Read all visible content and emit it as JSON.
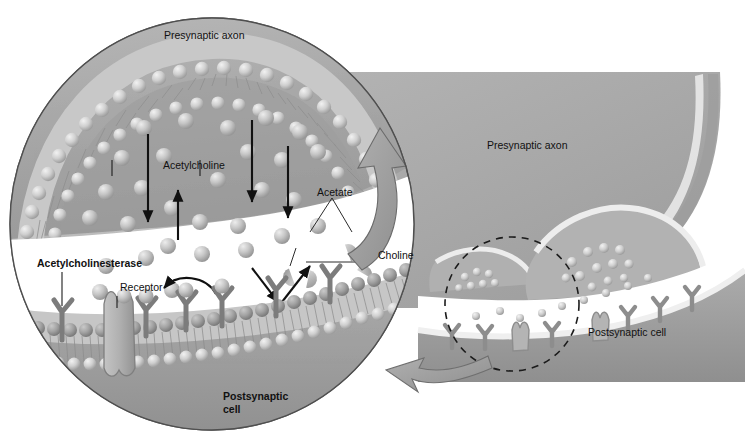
{
  "figure": {
    "type": "biological-diagram",
    "background_color": "#ffffff"
  },
  "colors": {
    "cytoplasm_gray": "#a6a6a6",
    "axon_gray": "#ababab",
    "postsynaptic_gray": "#a2a2a2",
    "membrane_head": "#c9c9c9",
    "receptor_dark": "#8a8a8a",
    "cleft_white": "#ffffff",
    "outline": "#4a4a4a",
    "arrow_black": "#111111",
    "big_arrow_fill": "#9a9a9a",
    "text": "#111111"
  },
  "magnified_view": {
    "name": "magnified-synapse-circle",
    "shape": "ellipse",
    "labels": {
      "presynaptic_axon": "Presynaptic axon",
      "acetylcholine": "Acetylcholine",
      "acetate": "Acetate",
      "choline": "Choline",
      "acetylcholinesterase": "Acetylcholinesterase",
      "receptor": "Receptor",
      "postsynaptic_cell_line1": "Postsynaptic",
      "postsynaptic_cell_line2": "cell"
    },
    "bold_labels": [
      "Acetylcholinesterase",
      "Postsynaptic cell"
    ],
    "arrows": [
      {
        "name": "ach-diffusion-arrow-1",
        "direction": "down"
      },
      {
        "name": "choline-reuptake-arrow",
        "direction": "up"
      },
      {
        "name": "ach-diffusion-arrow-2",
        "direction": "down"
      },
      {
        "name": "ach-diffusion-arrow-3",
        "direction": "down"
      },
      {
        "name": "ach-to-esterase-arrow",
        "direction": "down-right"
      },
      {
        "name": "breakdown-products-arrow",
        "direction": "up-right"
      },
      {
        "name": "receptor-binding-arrow",
        "direction": "curved-left"
      },
      {
        "name": "choline-recycling-arrow",
        "direction": "curved-up"
      }
    ]
  },
  "overview_view": {
    "name": "overview-synapse",
    "labels": {
      "presynaptic_axon": "Presynaptic axon",
      "postsynaptic_cell": "Postsynaptic cell"
    },
    "callout": {
      "name": "dashed-callout-circle",
      "style": "dashed",
      "pointer_arrow": "curved-left-arrow-to-magnified-view"
    }
  },
  "molecules": {
    "acetylcholine": {
      "shape": "sphere",
      "name": "acetylcholine-molecule"
    },
    "acetate": {
      "shape": "half-disc",
      "name": "acetate-fragment"
    },
    "choline": {
      "shape": "half-disc",
      "name": "choline-fragment"
    },
    "vesicle": {
      "shape": "sphere-cluster",
      "name": "synaptic-vesicle"
    }
  }
}
